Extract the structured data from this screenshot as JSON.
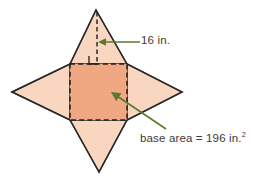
{
  "figure": {
    "colors": {
      "face_fill": "#f8d6c0",
      "base_fill": "#f0a882",
      "outline": "#2b2b2b",
      "dashed": "#1f1f1f",
      "annotation": "#5a7a2e",
      "text": "#3b3b3b",
      "background": "#ffffff"
    },
    "shape": {
      "type": "star-net",
      "tips": {
        "top": [
          96,
          10
        ],
        "right": [
          182,
          92
        ],
        "bottom": [
          99,
          172
        ],
        "left": [
          12,
          92
        ]
      },
      "base_square": {
        "x": 70,
        "y": 64,
        "width": 57,
        "height": 56
      }
    }
  },
  "annotations": {
    "height": {
      "label": "16 in.",
      "value": 16,
      "unit": "in.",
      "arrow_from": [
        140,
        42
      ],
      "arrow_to": [
        99,
        42
      ]
    },
    "base_area": {
      "label_prefix": "base area = 196 in.",
      "exponent": "2",
      "value": 196,
      "unit": "in.",
      "arrow_from": [
        165,
        128
      ],
      "arrow_to": [
        112,
        92
      ]
    },
    "right_angle_marker": {
      "name": "right-angle-marker",
      "at": [
        97,
        63
      ]
    }
  }
}
